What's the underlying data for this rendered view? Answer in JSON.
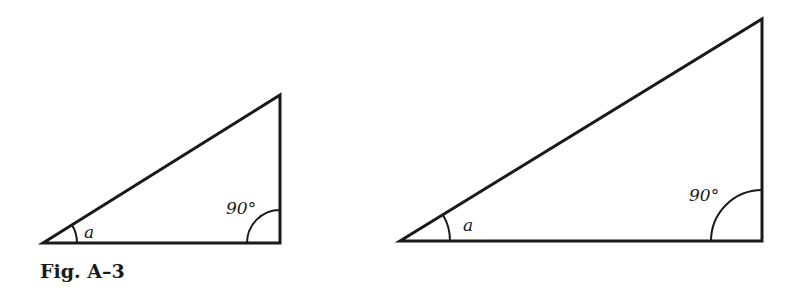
{
  "figure": {
    "caption": "Fig. A–3",
    "stroke_color": "#1a1a1a",
    "background": "#ffffff"
  },
  "triangles": [
    {
      "id": "small",
      "vertices": {
        "acute": [
          43,
          243
        ],
        "right": [
          280,
          243
        ],
        "top": [
          280,
          95
        ]
      },
      "acute_angle_label": "a",
      "right_angle_label": "90°"
    },
    {
      "id": "large",
      "vertices": {
        "acute": [
          400,
          241
        ],
        "right": [
          762,
          241
        ],
        "top": [
          762,
          19
        ]
      },
      "acute_angle_label": "a",
      "right_angle_label": "90°"
    }
  ]
}
